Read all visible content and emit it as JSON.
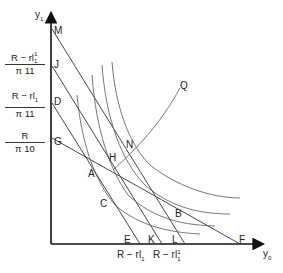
{
  "axes": {
    "y_axis_label": "y",
    "y_axis_sub": "1",
    "x_axis_label": "y",
    "x_axis_sub": "0"
  },
  "y_ticks": [
    {
      "num": "R − rl",
      "num_sub": "1",
      "num_sup": "1",
      "den": "π",
      "den_sub": "11"
    },
    {
      "num": "R − rl",
      "num_sub": "1",
      "den": "π",
      "den_sub": "11"
    },
    {
      "num": "R",
      "den": "π",
      "den_sub": "10"
    }
  ],
  "x_ticks": [
    {
      "text": "R − rl",
      "sub": "1"
    },
    {
      "text": "R − rl",
      "sub": "1",
      "sup": "1"
    }
  ],
  "points": {
    "M": "M",
    "J": "J",
    "D": "D",
    "G": "G",
    "A": "A",
    "C": "C",
    "H": "H",
    "N": "N",
    "Q": "Q",
    "B": "B",
    "E": "E",
    "K": "K",
    "L": "L",
    "F": "F"
  },
  "colors": {
    "line": "#333333",
    "curve": "#555555",
    "axis": "#111111"
  }
}
